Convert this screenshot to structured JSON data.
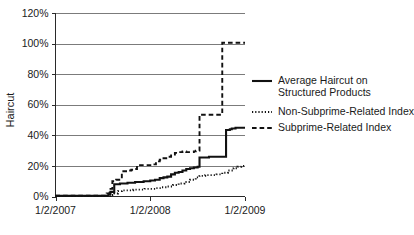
{
  "chart_data": {
    "type": "line",
    "title": "",
    "xlabel": "",
    "ylabel": "Haircut",
    "ylim": [
      0,
      120
    ],
    "xlim": [
      "1/2/2007",
      "1/2/2009"
    ],
    "grid": true,
    "legend_position": "right",
    "y_ticks": [
      "0%",
      "20%",
      "40%",
      "60%",
      "80%",
      "100%",
      "120%"
    ],
    "y_tick_values": [
      0,
      20,
      40,
      60,
      80,
      100,
      120
    ],
    "x_ticks": [
      "1/2/2007",
      "1/2/2008",
      "1/2/2009"
    ],
    "x_tick_values": [
      0,
      1,
      2
    ],
    "series": [
      {
        "name": "Average Haircut on Structured Products",
        "style": "solid",
        "color": "#111111",
        "x": [
          0.0,
          0.52,
          0.56,
          0.58,
          0.62,
          0.64,
          0.68,
          0.72,
          0.76,
          0.8,
          0.84,
          0.88,
          0.93,
          0.97,
          1.0,
          1.05,
          1.1,
          1.14,
          1.18,
          1.22,
          1.26,
          1.3,
          1.34,
          1.38,
          1.42,
          1.46,
          1.5,
          1.52,
          1.58,
          1.62,
          1.66,
          1.7,
          1.75,
          1.8,
          1.84,
          1.86,
          1.9,
          1.94,
          2.0
        ],
        "y": [
          0.5,
          0.5,
          1.5,
          3.0,
          8.0,
          8.0,
          8.5,
          8.5,
          9.0,
          9.0,
          9.5,
          9.5,
          10.0,
          10.0,
          10.5,
          11.0,
          12.0,
          12.5,
          13.0,
          14.5,
          15.5,
          16.0,
          17.0,
          18.0,
          18.5,
          19.0,
          19.5,
          25.5,
          25.5,
          26.0,
          26.0,
          26.0,
          26.0,
          43.5,
          44.0,
          44.5,
          45.0,
          45.0,
          45.0
        ]
      },
      {
        "name": "Non-Subprime-Related Index",
        "style": "dotted",
        "color": "#111111",
        "x": [
          0.0,
          0.52,
          0.58,
          0.62,
          0.66,
          0.7,
          0.76,
          0.82,
          0.88,
          0.94,
          1.0,
          1.06,
          1.12,
          1.18,
          1.24,
          1.3,
          1.36,
          1.42,
          1.48,
          1.52,
          1.58,
          1.64,
          1.7,
          1.76,
          1.82,
          1.88,
          1.92,
          1.96,
          2.0
        ],
        "y": [
          0.3,
          0.3,
          1.0,
          2.0,
          3.5,
          4.0,
          4.0,
          4.5,
          4.5,
          5.0,
          5.0,
          5.5,
          6.0,
          6.5,
          7.5,
          8.5,
          9.5,
          11.0,
          12.5,
          13.5,
          14.0,
          14.0,
          14.5,
          15.5,
          17.0,
          18.5,
          19.5,
          20.0,
          20.0
        ]
      },
      {
        "name": "Subprime-Related Index",
        "style": "dashed",
        "color": "#111111",
        "x": [
          0.0,
          0.5,
          0.54,
          0.57,
          0.6,
          0.64,
          0.7,
          0.76,
          0.8,
          0.84,
          0.86,
          0.92,
          0.98,
          1.02,
          1.06,
          1.1,
          1.14,
          1.18,
          1.22,
          1.26,
          1.3,
          1.34,
          1.38,
          1.42,
          1.46,
          1.48,
          1.52,
          1.58,
          1.64,
          1.7,
          1.74,
          1.76,
          1.82,
          1.88,
          2.0
        ],
        "y": [
          0.6,
          0.6,
          2.0,
          5.0,
          10.0,
          11.0,
          16.5,
          17.0,
          17.5,
          18.0,
          20.5,
          20.5,
          20.5,
          21.0,
          23.0,
          24.0,
          25.0,
          26.0,
          27.5,
          28.5,
          29.0,
          29.5,
          29.0,
          29.0,
          29.5,
          30.0,
          53.5,
          53.5,
          53.5,
          53.5,
          53.5,
          100.5,
          100.5,
          100.5,
          100.5
        ]
      }
    ]
  },
  "legend": {
    "items": [
      {
        "label_line1": "Average Haircut on",
        "label_line2": "Structured Products",
        "style": "solid"
      },
      {
        "label_line1": "Non-Subprime-Related Index",
        "label_line2": "",
        "style": "dotted"
      },
      {
        "label_line1": "Subprime-Related Index",
        "label_line2": "",
        "style": "dashed"
      }
    ]
  }
}
